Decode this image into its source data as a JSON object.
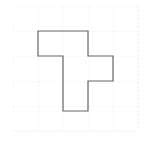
{
  "figure": {
    "title": "",
    "canvas": {
      "width": 145,
      "height": 148,
      "background_color": "#ffffff"
    },
    "grid": {
      "visible": true,
      "style": "dotted",
      "color": "#eeeeee",
      "spacing_px": 25,
      "origin_x": 13,
      "origin_y": 6,
      "x_lines": [
        13,
        38,
        63,
        88,
        113,
        138
      ],
      "y_lines": [
        6,
        31,
        56,
        81,
        106,
        131
      ],
      "columns": 5,
      "rows": 5
    },
    "shape": {
      "name": "orthogonal-polygon",
      "kind": "rectilinear-polygon",
      "stroke_color": "#666666",
      "stroke_width": 1.2,
      "fill_color": "none",
      "cell_size": 25,
      "vertices_grid": [
        [
          1,
          1
        ],
        [
          3,
          1
        ],
        [
          3,
          2
        ],
        [
          4,
          2
        ],
        [
          4,
          3
        ],
        [
          3,
          3
        ],
        [
          3,
          5
        ],
        [
          2,
          5
        ],
        [
          2,
          2
        ],
        [
          1,
          2
        ]
      ],
      "vertices_px": [
        [
          38,
          31
        ],
        [
          88,
          31
        ],
        [
          88,
          56
        ],
        [
          113,
          56
        ],
        [
          113,
          81
        ],
        [
          88,
          81
        ],
        [
          88,
          111
        ],
        [
          63,
          111
        ],
        [
          63,
          56
        ],
        [
          38,
          56
        ]
      ],
      "points_attr": "38,31 88,31 88,56 113,56 113,81 88,81 88,111 63,111 63,56 38,56",
      "vertex_count": 10,
      "area_cells": 7
    }
  }
}
